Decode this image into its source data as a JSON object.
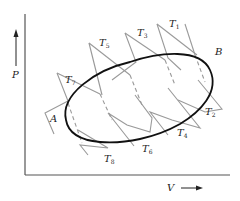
{
  "diagram": {
    "axes": {
      "y_label": "P",
      "x_label": "V",
      "y_arrow": "up-arrow",
      "x_arrow": "right-arrow"
    },
    "cycle_points": {
      "A": "A",
      "B": "B"
    },
    "isotherms": [
      {
        "label": "T",
        "sub": "1"
      },
      {
        "label": "T",
        "sub": "2"
      },
      {
        "label": "T",
        "sub": "3"
      },
      {
        "label": "T",
        "sub": "4"
      },
      {
        "label": "T",
        "sub": "5"
      },
      {
        "label": "T",
        "sub": "6"
      },
      {
        "label": "T",
        "sub": "7"
      },
      {
        "label": "T",
        "sub": "8"
      }
    ],
    "colors": {
      "cycle": "#111111",
      "isotherm": "#9a9a9a",
      "axis": "#555555"
    }
  }
}
